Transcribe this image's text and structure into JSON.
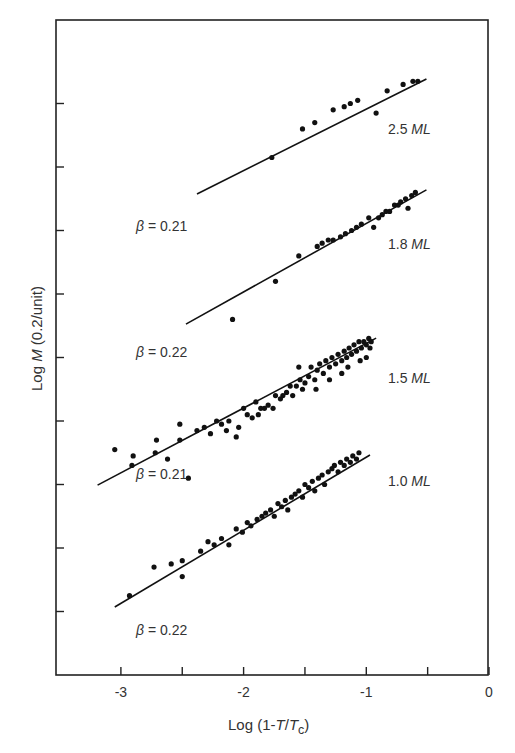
{
  "chart_data": {
    "type": "scatter",
    "title": "",
    "xlabel": "Log (1-T/Tc)",
    "xlabel_parts": {
      "prefix": "Log (1-",
      "T": "T",
      "slash": "/",
      "Tc": "T",
      "sub": "c",
      "suffix": ")"
    },
    "ylabel": "Log M (0.2/unit)",
    "ylabel_parts": {
      "prefix": "Log ",
      "M": "M",
      "suffix": " (0.2/unit)"
    },
    "xlim": [
      -3.5,
      0
    ],
    "ylim": [
      0,
      2.07
    ],
    "xticks": [
      -3,
      -2.5,
      -2,
      -1.5,
      -1,
      -0.5,
      0
    ],
    "xtick_labels": {
      "-3": "-3",
      "-2": "-2",
      "-1": "-1",
      "0": "0"
    },
    "yticks": [
      0.2,
      0.4,
      0.6,
      0.8,
      1.0,
      1.2,
      1.4,
      1.6,
      1.8
    ],
    "ytick_labels": [],
    "grid": false,
    "legend": "none",
    "series": [
      {
        "name": "2.5 ML",
        "label_thickness": "2.5",
        "label_unit": "ML",
        "beta": "β = 0.21",
        "fit": {
          "x": [
            -2.38,
            -0.51
          ],
          "y": [
            1.515,
            1.877
          ]
        },
        "points": [
          [
            -1.77,
            1.63
          ],
          [
            -1.52,
            1.72
          ],
          [
            -1.42,
            1.74
          ],
          [
            -1.27,
            1.78
          ],
          [
            -1.18,
            1.79
          ],
          [
            -1.13,
            1.8
          ],
          [
            -1.07,
            1.81
          ],
          [
            -0.92,
            1.77
          ],
          [
            -0.83,
            1.84
          ],
          [
            -0.7,
            1.86
          ],
          [
            -0.62,
            1.87
          ],
          [
            -0.58,
            1.87
          ]
        ]
      },
      {
        "name": "1.8 ML",
        "label_thickness": "1.8",
        "label_unit": "ML",
        "beta": "β = 0.22",
        "fit": {
          "x": [
            -2.47,
            -0.51
          ],
          "y": [
            1.105,
            1.528
          ]
        },
        "points": [
          [
            -2.09,
            1.12
          ],
          [
            -1.74,
            1.24
          ],
          [
            -1.55,
            1.32
          ],
          [
            -1.4,
            1.35
          ],
          [
            -1.36,
            1.36
          ],
          [
            -1.31,
            1.37
          ],
          [
            -1.27,
            1.37
          ],
          [
            -1.21,
            1.38
          ],
          [
            -1.17,
            1.39
          ],
          [
            -1.12,
            1.4
          ],
          [
            -1.08,
            1.41
          ],
          [
            -1.04,
            1.42
          ],
          [
            -0.98,
            1.44
          ],
          [
            -0.94,
            1.41
          ],
          [
            -0.9,
            1.44
          ],
          [
            -0.87,
            1.45
          ],
          [
            -0.84,
            1.46
          ],
          [
            -0.81,
            1.46
          ],
          [
            -0.77,
            1.48
          ],
          [
            -0.74,
            1.48
          ],
          [
            -0.72,
            1.49
          ],
          [
            -0.68,
            1.5
          ],
          [
            -0.66,
            1.47
          ],
          [
            -0.63,
            1.51
          ],
          [
            -0.6,
            1.52
          ]
        ]
      },
      {
        "name": "1.5 ML",
        "label_thickness": "1.5",
        "label_unit": "ML",
        "beta": "β = 0.21",
        "fit": {
          "x": [
            -3.19,
            -0.92
          ],
          "y": [
            0.598,
            1.061
          ]
        },
        "points": [
          [
            -3.05,
            0.71
          ],
          [
            -2.9,
            0.69
          ],
          [
            -2.91,
            0.66
          ],
          [
            -2.72,
            0.7
          ],
          [
            -2.71,
            0.74
          ],
          [
            -2.62,
            0.68
          ],
          [
            -2.52,
            0.74
          ],
          [
            -2.52,
            0.79
          ],
          [
            -2.45,
            0.62
          ],
          [
            -2.38,
            0.77
          ],
          [
            -2.32,
            0.78
          ],
          [
            -2.27,
            0.76
          ],
          [
            -2.22,
            0.8
          ],
          [
            -2.18,
            0.79
          ],
          [
            -2.14,
            0.77
          ],
          [
            -2.12,
            0.8
          ],
          [
            -2.06,
            0.75
          ],
          [
            -2.04,
            0.78
          ],
          [
            -2.0,
            0.84
          ],
          [
            -1.97,
            0.82
          ],
          [
            -1.93,
            0.81
          ],
          [
            -1.9,
            0.86
          ],
          [
            -1.88,
            0.82
          ],
          [
            -1.86,
            0.84
          ],
          [
            -1.83,
            0.84
          ],
          [
            -1.8,
            0.85
          ],
          [
            -1.76,
            0.84
          ],
          [
            -1.74,
            0.88
          ],
          [
            -1.7,
            0.87
          ],
          [
            -1.68,
            0.88
          ],
          [
            -1.65,
            0.89
          ],
          [
            -1.62,
            0.91
          ],
          [
            -1.6,
            0.88
          ],
          [
            -1.57,
            0.91
          ],
          [
            -1.54,
            0.93
          ],
          [
            -1.52,
            0.9
          ],
          [
            -1.5,
            0.92
          ],
          [
            -1.47,
            0.94
          ],
          [
            -1.45,
            0.97
          ],
          [
            -1.42,
            0.93
          ],
          [
            -1.4,
            0.96
          ],
          [
            -1.38,
            0.98
          ],
          [
            -1.35,
            0.95
          ],
          [
            -1.33,
            0.99
          ],
          [
            -1.3,
            0.97
          ],
          [
            -1.28,
            1.0
          ],
          [
            -1.25,
            0.98
          ],
          [
            -1.23,
            1.01
          ],
          [
            -1.2,
            0.99
          ],
          [
            -1.18,
            1.02
          ],
          [
            -1.16,
            1.0
          ],
          [
            -1.14,
            1.03
          ],
          [
            -1.12,
            1.01
          ],
          [
            -1.1,
            1.04
          ],
          [
            -1.08,
            1.02
          ],
          [
            -1.06,
            1.05
          ],
          [
            -1.04,
            1.03
          ],
          [
            -1.02,
            1.05
          ],
          [
            -1.0,
            1.04
          ],
          [
            -0.98,
            1.06
          ],
          [
            -0.97,
            1.03
          ],
          [
            -0.96,
            1.05
          ],
          [
            -1.41,
            0.9
          ],
          [
            -1.55,
            0.97
          ],
          [
            -1.3,
            0.93
          ],
          [
            -1.2,
            0.95
          ],
          [
            -1.15,
            0.97
          ],
          [
            -1.05,
            0.99
          ],
          [
            -1.0,
            1.0
          ]
        ]
      },
      {
        "name": "1.0 ML",
        "label_thickness": "1.0",
        "label_unit": "ML",
        "beta": "β = 0.22",
        "fit": {
          "x": [
            -3.05,
            -0.97
          ],
          "y": [
            0.214,
            0.693
          ]
        },
        "points": [
          [
            -2.93,
            0.25
          ],
          [
            -2.73,
            0.34
          ],
          [
            -2.59,
            0.35
          ],
          [
            -2.5,
            0.36
          ],
          [
            -2.5,
            0.31
          ],
          [
            -2.35,
            0.39
          ],
          [
            -2.29,
            0.42
          ],
          [
            -2.24,
            0.41
          ],
          [
            -2.18,
            0.43
          ],
          [
            -2.12,
            0.41
          ],
          [
            -2.06,
            0.46
          ],
          [
            -2.01,
            0.45
          ],
          [
            -1.97,
            0.48
          ],
          [
            -1.94,
            0.47
          ],
          [
            -1.89,
            0.49
          ],
          [
            -1.85,
            0.5
          ],
          [
            -1.82,
            0.51
          ],
          [
            -1.78,
            0.52
          ],
          [
            -1.75,
            0.5
          ],
          [
            -1.72,
            0.54
          ],
          [
            -1.69,
            0.53
          ],
          [
            -1.66,
            0.55
          ],
          [
            -1.64,
            0.52
          ],
          [
            -1.61,
            0.56
          ],
          [
            -1.58,
            0.57
          ],
          [
            -1.55,
            0.58
          ],
          [
            -1.52,
            0.56
          ],
          [
            -1.5,
            0.6
          ],
          [
            -1.47,
            0.59
          ],
          [
            -1.44,
            0.61
          ],
          [
            -1.42,
            0.58
          ],
          [
            -1.39,
            0.62
          ],
          [
            -1.36,
            0.63
          ],
          [
            -1.34,
            0.6
          ],
          [
            -1.31,
            0.64
          ],
          [
            -1.28,
            0.65
          ],
          [
            -1.26,
            0.66
          ],
          [
            -1.23,
            0.64
          ],
          [
            -1.21,
            0.67
          ],
          [
            -1.18,
            0.66
          ],
          [
            -1.16,
            0.68
          ],
          [
            -1.13,
            0.67
          ],
          [
            -1.11,
            0.69
          ],
          [
            -1.08,
            0.68
          ],
          [
            -1.06,
            0.7
          ]
        ]
      }
    ]
  }
}
